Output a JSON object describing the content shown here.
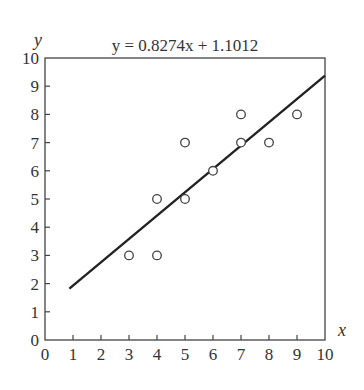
{
  "chart_data": {
    "type": "scatter",
    "title": "y = 0.8274x + 1.1012",
    "xlabel": "x",
    "ylabel": "y",
    "xlim": [
      0,
      10
    ],
    "ylim": [
      0,
      10
    ],
    "grid": false,
    "legend": null,
    "x_ticks": [
      0,
      1,
      2,
      3,
      4,
      5,
      6,
      7,
      8,
      9,
      10
    ],
    "y_ticks": [
      0,
      1,
      2,
      3,
      4,
      5,
      6,
      7,
      8,
      9,
      10
    ],
    "series": [
      {
        "name": "observations",
        "marker": "open-circle",
        "points": [
          {
            "x": 3,
            "y": 3
          },
          {
            "x": 4,
            "y": 3
          },
          {
            "x": 4,
            "y": 5
          },
          {
            "x": 5,
            "y": 5
          },
          {
            "x": 5,
            "y": 7
          },
          {
            "x": 6,
            "y": 6
          },
          {
            "x": 7,
            "y": 7
          },
          {
            "x": 7,
            "y": 8
          },
          {
            "x": 8,
            "y": 7
          },
          {
            "x": 9,
            "y": 8
          }
        ]
      }
    ],
    "regression_line": {
      "slope": 0.8274,
      "intercept": 1.1012,
      "x_start": 0.87,
      "x_end": 10
    }
  },
  "colors": {
    "axis": "#444444",
    "line": "#222222",
    "marker": "#444444",
    "text": "#333333"
  }
}
